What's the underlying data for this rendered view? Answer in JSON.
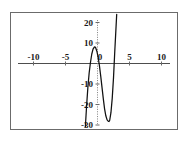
{
  "figure": {
    "background_color": "#ffffff",
    "frame_color": "#6b6b6b",
    "curve_color": "#111111",
    "axis_color": "#4d4d4d"
  },
  "chart_data": {
    "type": "line",
    "title": "",
    "subtitle": "",
    "xlabel": "",
    "ylabel": "",
    "grid": false,
    "legend": null,
    "xlim": [
      -11.5,
      11.5
    ],
    "ylim": [
      -33,
      23
    ],
    "x_ticks": [
      -10,
      -5,
      0,
      5,
      10
    ],
    "x_tick_labels": [
      "-10",
      "-5",
      "0",
      "5",
      "10"
    ],
    "y_ticks": [
      -30,
      -20,
      -10,
      10,
      20
    ],
    "y_tick_labels": [
      "-30",
      "-20",
      "-10",
      "10",
      "20"
    ],
    "x_axis_position": 0,
    "y_axis_position": 0,
    "y_axis_style": "dotted",
    "annotations": [],
    "series": [
      {
        "name": "curve",
        "description": "cubic polynomial with local maximum near (-0.4, 8) and local minimum near (1.8, -28)",
        "local_maximum": [
          -0.4,
          8
        ],
        "local_minimum": [
          1.8,
          -28
        ],
        "x": [
          -1.9,
          -1.7,
          -1.5,
          -1.3,
          -1.1,
          -0.9,
          -0.7,
          -0.5,
          -0.4,
          -0.3,
          -0.1,
          0.1,
          0.3,
          0.5,
          0.7,
          0.9,
          1.1,
          1.3,
          1.5,
          1.7,
          1.8,
          1.9,
          2.1,
          2.3,
          2.5,
          2.7,
          2.9,
          3.0
        ],
        "y": [
          -31,
          -20.5,
          -11.5,
          -4.5,
          0.5,
          4.5,
          7.0,
          8.0,
          8.1,
          7.8,
          6.0,
          3.0,
          -1.0,
          -6.0,
          -11.5,
          -17.0,
          -22.0,
          -25.5,
          -27.5,
          -28.2,
          -28.3,
          -27.8,
          -24.0,
          -17.0,
          -7.0,
          6.0,
          18.0,
          24.0
        ]
      }
    ]
  },
  "labels": {
    "x_neg_ten": "-10",
    "x_neg_five": "-5",
    "x_zero": "0",
    "x_five": "5",
    "x_ten": "10",
    "y_twenty": "20",
    "y_ten": "10",
    "y_neg_ten": "-10",
    "y_neg_twenty": "-20",
    "y_neg_thirty": "-30"
  }
}
